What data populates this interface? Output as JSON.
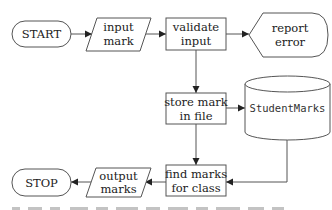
{
  "diagram": {
    "type": "flowchart",
    "nodes": {
      "start": {
        "label": "START",
        "shape": "terminator"
      },
      "input_mark": {
        "line1": "input",
        "line2": "mark",
        "shape": "input-output"
      },
      "validate_input": {
        "line1": "validate",
        "line2": "input",
        "shape": "process"
      },
      "report_error": {
        "line1": "report",
        "line2": "error",
        "shape": "display"
      },
      "store_mark": {
        "line1": "store mark",
        "line2": "in file",
        "shape": "process"
      },
      "student_marks": {
        "label": "StudentMarks",
        "shape": "database"
      },
      "find_marks": {
        "line1": "find marks",
        "line2": "for class",
        "shape": "process"
      },
      "output_marks": {
        "line1": "output",
        "line2": "marks",
        "shape": "input-output"
      },
      "stop": {
        "label": "STOP",
        "shape": "terminator"
      }
    },
    "edges": [
      {
        "from": "start",
        "to": "input_mark"
      },
      {
        "from": "input_mark",
        "to": "validate_input"
      },
      {
        "from": "validate_input",
        "to": "report_error"
      },
      {
        "from": "validate_input",
        "to": "store_mark"
      },
      {
        "from": "store_mark",
        "to": "student_marks"
      },
      {
        "from": "store_mark",
        "to": "find_marks"
      },
      {
        "from": "student_marks",
        "to": "find_marks"
      },
      {
        "from": "find_marks",
        "to": "output_marks"
      },
      {
        "from": "output_marks",
        "to": "stop"
      }
    ],
    "colors": {
      "stroke": "#555555",
      "fill": "#ffffff",
      "text": "#222222"
    }
  }
}
